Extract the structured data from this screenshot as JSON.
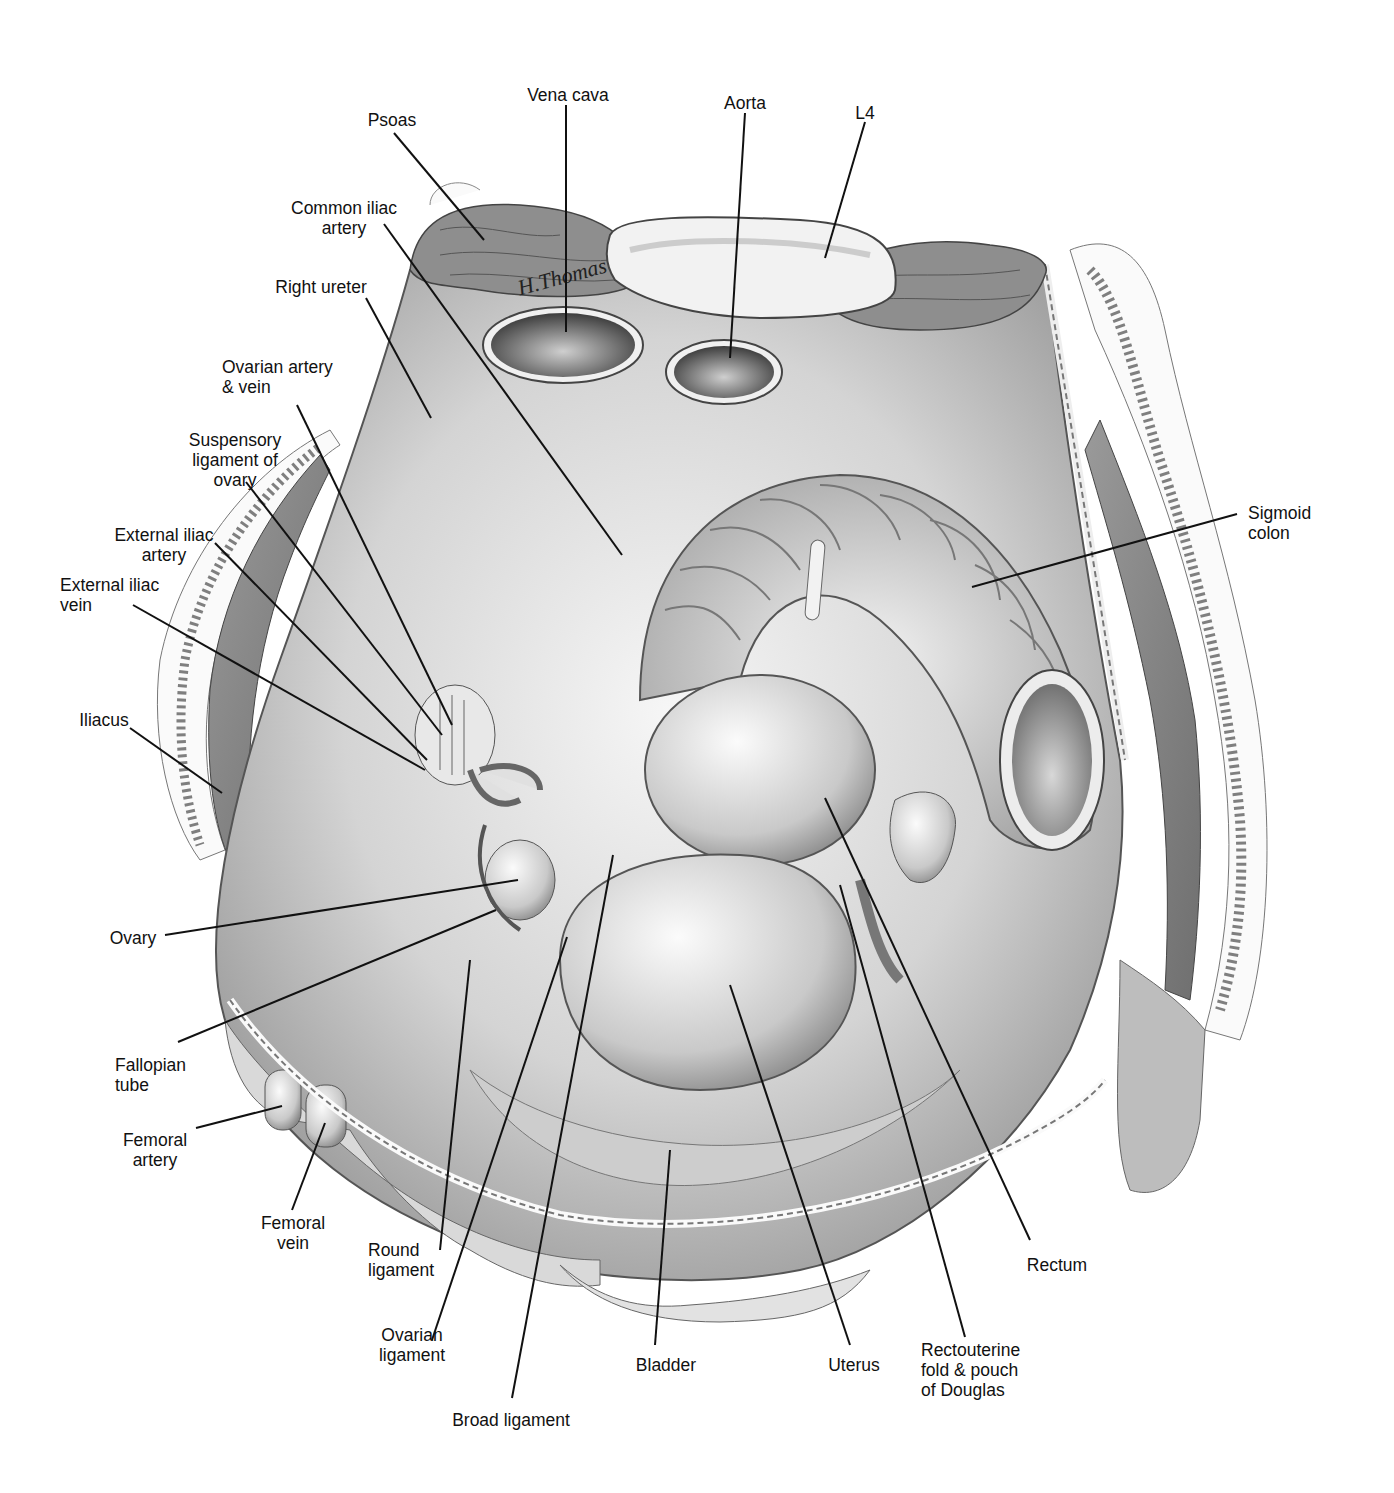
{
  "figure": {
    "signature": "H.Thomas",
    "colors": {
      "line": "#111111",
      "tissue_light": "#e8e8e8",
      "tissue_mid": "#bdbdbd",
      "tissue_dark": "#7a7a7a",
      "muscle": "#8c8c8c",
      "background": "#ffffff"
    }
  },
  "labels": [
    {
      "id": "vena-cava",
      "text": "Vena cava",
      "x": 568,
      "y": 85,
      "align": "c",
      "line": [
        [
          566,
          105
        ],
        [
          566,
          332
        ]
      ]
    },
    {
      "id": "aorta",
      "text": "Aorta",
      "x": 745,
      "y": 93,
      "align": "c",
      "line": [
        [
          745,
          113
        ],
        [
          730,
          358
        ]
      ]
    },
    {
      "id": "l4",
      "text": "L4",
      "x": 865,
      "y": 103,
      "align": "c",
      "line": [
        [
          865,
          122
        ],
        [
          825,
          258
        ]
      ]
    },
    {
      "id": "psoas",
      "text": "Psoas",
      "x": 392,
      "y": 110,
      "align": "c",
      "line": [
        [
          394,
          133
        ],
        [
          484,
          240
        ]
      ]
    },
    {
      "id": "common-iliac-artery",
      "text": "Common iliac\nartery",
      "x": 344,
      "y": 200,
      "align": "c",
      "line": [
        [
          384,
          224
        ],
        [
          622,
          555
        ]
      ]
    },
    {
      "id": "right-ureter",
      "text": "Right ureter",
      "x": 321,
      "y": 277,
      "align": "c",
      "line": [
        [
          366,
          298
        ],
        [
          431,
          418
        ]
      ]
    },
    {
      "id": "ovarian-artery-vein",
      "text": "Ovarian artery\n& vein",
      "x": 272,
      "y": 357,
      "align": "c",
      "line": [
        [
          297,
          405
        ],
        [
          452,
          725
        ]
      ]
    },
    {
      "id": "suspensory-ligament",
      "text": "Suspensory\nligament of\novary",
      "x": 235,
      "y": 430,
      "align": "c",
      "line": [
        [
          246,
          482
        ],
        [
          442,
          735
        ]
      ]
    },
    {
      "id": "external-iliac-artery",
      "text": "External iliac\nartery",
      "x": 164,
      "y": 525,
      "align": "c",
      "line": [
        [
          215,
          543
        ],
        [
          427,
          760
        ]
      ]
    },
    {
      "id": "external-iliac-vein",
      "text": "External iliac\nvein",
      "x": 130,
      "y": 575,
      "align": "c",
      "line": [
        [
          133,
          605
        ],
        [
          425,
          770
        ]
      ]
    },
    {
      "id": "iliacus",
      "text": "Iliacus",
      "x": 104,
      "y": 710,
      "align": "c",
      "line": [
        [
          130,
          728
        ],
        [
          222,
          793
        ]
      ]
    },
    {
      "id": "ovary",
      "text": "Ovary",
      "x": 133,
      "y": 928,
      "align": "c",
      "line": [
        [
          165,
          935
        ],
        [
          518,
          880
        ]
      ]
    },
    {
      "id": "fallopian-tube",
      "text": "Fallopian\ntube",
      "x": 156,
      "y": 1055,
      "align": "c",
      "line": [
        [
          178,
          1042
        ],
        [
          496,
          910
        ]
      ]
    },
    {
      "id": "femoral-artery",
      "text": "Femoral\nartery",
      "x": 155,
      "y": 1130,
      "align": "c",
      "line": [
        [
          196,
          1128
        ],
        [
          282,
          1106
        ]
      ]
    },
    {
      "id": "femoral-vein",
      "text": "Femoral\nvein",
      "x": 293,
      "y": 1213,
      "align": "c",
      "line": [
        [
          292,
          1210
        ],
        [
          325,
          1123
        ]
      ]
    },
    {
      "id": "round-ligament",
      "text": "Round\nligament",
      "x": 418,
      "y": 1240,
      "align": "c",
      "line": [
        [
          440,
          1250
        ],
        [
          470,
          960
        ]
      ]
    },
    {
      "id": "ovarian-ligament",
      "text": "Ovarian\nligament",
      "x": 412,
      "y": 1325,
      "align": "c",
      "line": [
        [
          432,
          1340
        ],
        [
          567,
          937
        ]
      ]
    },
    {
      "id": "broad-ligament",
      "text": "Broad ligament",
      "x": 511,
      "y": 1410,
      "align": "c",
      "line": [
        [
          512,
          1398
        ],
        [
          613,
          855
        ]
      ]
    },
    {
      "id": "bladder",
      "text": "Bladder",
      "x": 666,
      "y": 1355,
      "align": "c",
      "line": [
        [
          655,
          1345
        ],
        [
          670,
          1150
        ]
      ]
    },
    {
      "id": "uterus",
      "text": "Uterus",
      "x": 854,
      "y": 1355,
      "align": "c",
      "line": [
        [
          850,
          1345
        ],
        [
          730,
          985
        ]
      ]
    },
    {
      "id": "rectouterine-fold",
      "text": "Rectouterine\nfold & pouch\nof Douglas",
      "x": 981,
      "y": 1340,
      "align": "c",
      "line": [
        [
          965,
          1337
        ],
        [
          840,
          885
        ]
      ]
    },
    {
      "id": "rectum",
      "text": "Rectum",
      "x": 1057,
      "y": 1255,
      "align": "c",
      "line": [
        [
          1030,
          1240
        ],
        [
          825,
          798
        ]
      ]
    },
    {
      "id": "sigmoid-colon",
      "text": "Sigmoid\ncolon",
      "x": 1298,
      "y": 503,
      "align": "c",
      "line": [
        [
          1237,
          514
        ],
        [
          972,
          587
        ]
      ]
    }
  ]
}
